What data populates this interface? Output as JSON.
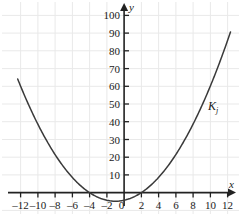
{
  "chart_data": {
    "type": "line",
    "title": "",
    "subtitle": "",
    "xlabel": "x",
    "ylabel": "y",
    "xlim": [
      -13,
      13
    ],
    "ylim": [
      -6,
      104
    ],
    "grid": true,
    "grid_color": "#e8e8e8",
    "axis_color": "#222222",
    "curve_color": "#333333",
    "background": "#ffffff",
    "legend_position": "inline-annotation",
    "xticks": [
      -12,
      -10,
      -8,
      -6,
      -4,
      -2,
      0,
      2,
      4,
      6,
      8,
      10,
      12
    ],
    "xtick_labels": [
      "–12",
      "–10",
      "–8",
      "–6",
      "–4",
      "–2",
      "0",
      "2",
      "4",
      "6",
      "8",
      "10",
      "12"
    ],
    "yticks": [
      10,
      20,
      30,
      40,
      50,
      60,
      70,
      80,
      90,
      100
    ],
    "ytick_labels": [
      "10",
      "20",
      "30",
      "40",
      "50",
      "60",
      "70",
      "80",
      "90",
      "100"
    ],
    "annotations": [
      {
        "text": "K",
        "subscript": "j",
        "x": 10.2,
        "y": 51
      }
    ],
    "series": [
      {
        "name": "K_j",
        "equation": "y = 0.54(x + 4)(x - 2)",
        "vertex": [
          -1,
          -4.9
        ],
        "roots": [
          -4,
          2
        ],
        "x": [
          -12,
          -11,
          -10,
          -9,
          -8,
          -7,
          -6,
          -5,
          -4,
          -3,
          -2,
          -1,
          0,
          1,
          2,
          3,
          4,
          5,
          6,
          7,
          8,
          9,
          10,
          11,
          12
        ],
        "values": [
          60.5,
          52.9,
          45.9,
          39.4,
          43.2,
          27.0,
          22.1,
          17.8,
          0.0,
          -4.3,
          -6.5,
          -4.9,
          -4.3,
          -5.4,
          0.0,
          7.6,
          17.3,
          29.2,
          43.2,
          59.4,
          43.2,
          58.3,
          65.9,
          75.6,
          86.4
        ]
      }
    ]
  },
  "figure": {
    "axis_label_x": "x",
    "axis_label_y": "y",
    "curve_label_main": "K",
    "curve_label_sub": "j"
  }
}
